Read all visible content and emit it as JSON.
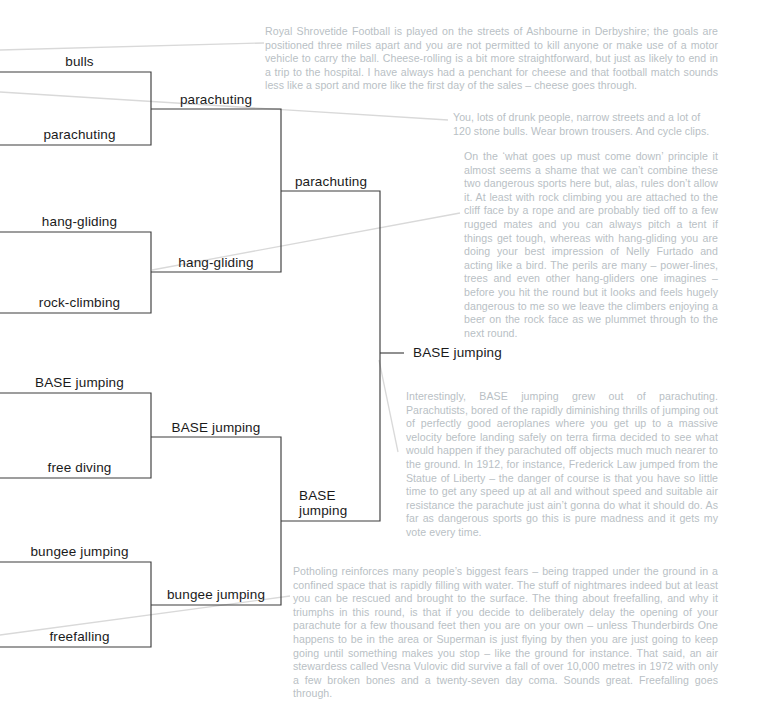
{
  "diagram": {
    "line_color_bracket": "#3a3a3a",
    "line_color_leader": "#d8d8d8",
    "text_color_label": "#1a1a1a",
    "text_color_commentary": "#b9bfc5",
    "background": "#ffffff"
  },
  "bracket": {
    "round1": [
      {
        "id": "r1-bulls",
        "label": "bulls"
      },
      {
        "id": "r1-parachuting",
        "label": "parachuting"
      },
      {
        "id": "r1-hang-gliding",
        "label": "hang-gliding"
      },
      {
        "id": "r1-rock-climbing",
        "label": "rock-climbing"
      },
      {
        "id": "r1-base-jumping",
        "label": "BASE jumping"
      },
      {
        "id": "r1-free-diving",
        "label": "free diving"
      },
      {
        "id": "r1-bungee-jumping",
        "label": "bungee jumping"
      },
      {
        "id": "r1-freefalling",
        "label": "freefalling"
      }
    ],
    "round2": [
      {
        "id": "r2-parachuting",
        "label": "parachuting"
      },
      {
        "id": "r2-hang-gliding",
        "label": "hang-gliding"
      },
      {
        "id": "r2-base-jumping",
        "label": "BASE jumping"
      },
      {
        "id": "r2-bungee-jumping",
        "label": "bungee jumping"
      }
    ],
    "round3": [
      {
        "id": "r3-parachuting",
        "label": "parachuting"
      },
      {
        "id": "r3-base-jumping",
        "label": "BASE jumping"
      }
    ],
    "winner": {
      "id": "winner-base-jumping",
      "label": "BASE jumping"
    }
  },
  "commentary": {
    "bulls_vs_parachuting": "Royal Shrovetide Football is played on the streets of Ashbourne in Derbyshire; the goals are positioned three miles apart and you are not permitted to kill anyone or make use of a motor vehicle to carry the ball. Cheese-rolling is a bit more straightforward, but just as likely to end in a trip to the hospital. I have always had a penchant for cheese and that football match sounds less like a sport and more like the first day of the sales – cheese goes through.",
    "bulls_note": "You, lots of drunk people, narrow streets and a lot of 120 stone bulls. Wear brown trousers. And cycle clips.",
    "hang_gliding_vs_rock_climbing": "On the ‘what goes up must come down’ principle it almost seems a shame that we can’t combine these two dangerous sports here but, alas, rules don’t allow it. At least with rock climbing you are attached to the cliff face by a rope and are probably tied off to a few rugged mates and you can always pitch a tent if things get tough, whereas with hang-gliding you are doing your best impression of Nelly Furtado and acting like a bird. The perils are many – power-lines, trees and even other hang-gliders one imagines – before you hit the round but it looks and feels hugely dangerous to me so we leave the climbers enjoying a beer on the rock face as we plummet through to the next round.",
    "base_jumping_note": "Interestingly, BASE jumping grew out of parachuting. Parachutists, bored of the rapidly diminishing thrills of jumping out of perfectly good aeroplanes where you get up to a massive velocity before landing safely on terra firma decided to see what would happen if they parachuted off objects much much nearer to the ground. In 1912, for instance, Frederick Law jumped from the Statue of Liberty – the danger of course is that you have so little time to get any speed up at all and without speed and suitable air resistance the parachute just ain’t gonna do what it should do. As far as dangerous sports go this is pure madness and it gets my vote every time.",
    "freefalling_note": "Potholing reinforces many people’s biggest fears – being trapped under the ground in a confined space that is rapidly filling with water. The stuff of nightmares indeed but at least you can be rescued and brought to the surface. The thing about freefalling, and why it triumphs in this round, is that if you decide to deliberately delay the opening of your parachute for a few thousand feet then you are on your own – unless Thunderbirds One happens to be in the area or Superman is just flying by then you are just going to keep going until something makes you stop – like the ground for instance. That said, an air stewardess called Vesna Vulovic did survive a fall of over 10,000 metres in 1972 with only a few broken bones and a twenty-seven day coma. Sounds great. Freefalling goes through."
  }
}
